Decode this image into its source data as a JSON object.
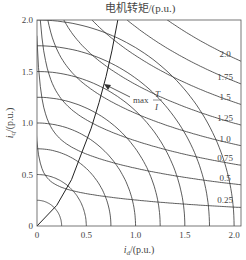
{
  "chart_data": {
    "type": "line",
    "title": "电机转矩/(p.u.)",
    "xlabel": "i_d/(p.u.)",
    "ylabel": "i_q/(p.u.)",
    "xlim": [
      0,
      2.07
    ],
    "ylim": [
      0,
      2.0
    ],
    "x_ticks": [
      "0",
      "0.5",
      "1.0",
      "1.5",
      "2.0"
    ],
    "y_ticks": [
      "0",
      "0.5",
      "1.0",
      "1.5",
      "2.0"
    ],
    "grid": false,
    "torque_contours": {
      "levels": [
        0.25,
        0.5,
        0.75,
        1.0,
        1.25,
        1.5,
        1.75,
        2.0
      ],
      "labels": [
        "0.25",
        "0.5",
        "0.75",
        "1.0",
        "1.25",
        "1.5",
        "1.75",
        "2.0"
      ],
      "label_iq_at_right": [
        0.18,
        0.4,
        0.59,
        0.78,
        0.98,
        1.18,
        1.38,
        1.6
      ]
    },
    "current_circles": {
      "radii": [
        0.25,
        0.5,
        0.75,
        1.0,
        1.25,
        1.5,
        1.75,
        2.0
      ]
    },
    "max_T_over_I_curve": {
      "label": "max T/I",
      "points": [
        [
          0,
          0
        ],
        [
          0.2,
          0.2
        ],
        [
          0.35,
          0.45
        ],
        [
          0.45,
          0.7
        ],
        [
          0.55,
          0.95
        ],
        [
          0.63,
          1.2
        ],
        [
          0.7,
          1.45
        ],
        [
          0.76,
          1.7
        ],
        [
          0.82,
          2.0
        ]
      ]
    }
  },
  "labels": {
    "title": "电机转矩/(p.u.)",
    "xlabel_i": "i",
    "xlabel_sub": "d",
    "xlabel_unit": "/(p.u.)",
    "ylabel_i": "i",
    "ylabel_sub": "q",
    "ylabel_unit": "/(p.u.)",
    "annot_max": "max",
    "annot_T": "T",
    "annot_I": "I"
  }
}
